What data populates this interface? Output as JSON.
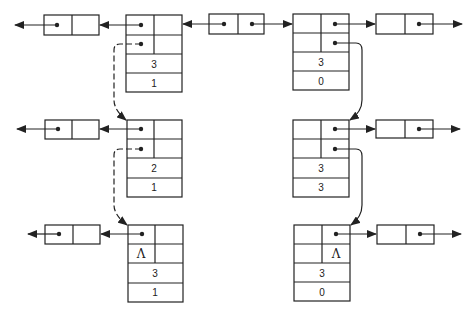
{
  "diagram": {
    "colors": {
      "line": "#222222",
      "background": "#ffffff"
    },
    "nodes": [
      {
        "id": "L1",
        "column": "left",
        "row": 1,
        "top_left": "",
        "top_right": "",
        "bottom_left": "",
        "bottom_right": "",
        "value_a": "3",
        "value_b": "1"
      },
      {
        "id": "L2",
        "column": "left",
        "row": 2,
        "top_left": "",
        "top_right": "",
        "bottom_left": "",
        "bottom_right": "",
        "value_a": "2",
        "value_b": "1"
      },
      {
        "id": "L3",
        "column": "left",
        "row": 3,
        "top_left": "",
        "top_right": "",
        "bottom_left": "Λ",
        "bottom_right": "",
        "value_a": "3",
        "value_b": "1"
      },
      {
        "id": "R1",
        "column": "right",
        "row": 1,
        "top_left": "",
        "top_right": "",
        "bottom_left": "",
        "bottom_right": "",
        "value_a": "3",
        "value_b": "0"
      },
      {
        "id": "R2",
        "column": "right",
        "row": 2,
        "top_left": "",
        "top_right": "",
        "bottom_left": "",
        "bottom_right": "",
        "value_a": "3",
        "value_b": "3"
      },
      {
        "id": "R3",
        "column": "right",
        "row": 3,
        "top_left": "",
        "top_right": "",
        "bottom_left": "",
        "bottom_right": "Λ",
        "value_a": "3",
        "value_b": "0"
      }
    ],
    "link_cells": [
      {
        "id": "left-row1",
        "position": "left of L1"
      },
      {
        "id": "center-row1",
        "position": "between L1 and R1"
      },
      {
        "id": "right-row1",
        "position": "right of R1"
      },
      {
        "id": "left-row2",
        "position": "left of L2"
      },
      {
        "id": "right-row2",
        "position": "right of R2"
      },
      {
        "id": "left-row3",
        "position": "left of L3"
      },
      {
        "id": "right-row3",
        "position": "right of R3"
      }
    ],
    "null_symbol": "Λ",
    "edges": [
      {
        "from": "L1.bottom_left",
        "to": "L2",
        "style": "dashed"
      },
      {
        "from": "L2.bottom_left",
        "to": "L3",
        "style": "dashed"
      },
      {
        "from": "R1.bottom_right",
        "to": "R2",
        "style": "solid"
      },
      {
        "from": "R2.bottom_right",
        "to": "R3",
        "style": "solid"
      }
    ]
  }
}
